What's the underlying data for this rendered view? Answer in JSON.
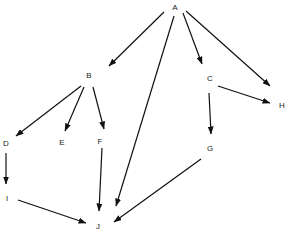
{
  "diagram": {
    "type": "directed-graph",
    "colors": {
      "edge": "#111111",
      "label": "#222222",
      "background": "#ffffff"
    },
    "nodes": [
      {
        "id": "A",
        "label": "A",
        "x": 175,
        "y": 8
      },
      {
        "id": "B",
        "label": "B",
        "x": 89,
        "y": 76
      },
      {
        "id": "C",
        "label": "C",
        "x": 210,
        "y": 79
      },
      {
        "id": "H",
        "label": "H",
        "x": 282,
        "y": 106
      },
      {
        "id": "D",
        "label": "D",
        "x": 6,
        "y": 144
      },
      {
        "id": "E",
        "label": "E",
        "x": 62,
        "y": 143
      },
      {
        "id": "F",
        "label": "F",
        "x": 100,
        "y": 142
      },
      {
        "id": "G",
        "label": "G",
        "x": 210,
        "y": 149
      },
      {
        "id": "I",
        "label": "I",
        "x": 7,
        "y": 199
      },
      {
        "id": "J",
        "label": "J",
        "x": 98,
        "y": 227
      }
    ],
    "edges": [
      {
        "from": "A",
        "to": "B",
        "x1": 164,
        "y1": 12,
        "x2": 109,
        "y2": 66
      },
      {
        "from": "A",
        "to": "J",
        "x1": 174,
        "y1": 16,
        "x2": 116,
        "y2": 206
      },
      {
        "from": "A",
        "to": "C",
        "x1": 183,
        "y1": 13,
        "x2": 202,
        "y2": 64
      },
      {
        "from": "A",
        "to": "H",
        "x1": 186,
        "y1": 11,
        "x2": 270,
        "y2": 86
      },
      {
        "from": "B",
        "to": "D",
        "x1": 81,
        "y1": 86,
        "x2": 16,
        "y2": 136
      },
      {
        "from": "B",
        "to": "E",
        "x1": 84,
        "y1": 87,
        "x2": 65,
        "y2": 131
      },
      {
        "from": "B",
        "to": "F",
        "x1": 93,
        "y1": 87,
        "x2": 104,
        "y2": 129
      },
      {
        "from": "C",
        "to": "H",
        "x1": 218,
        "y1": 86,
        "x2": 270,
        "y2": 103
      },
      {
        "from": "C",
        "to": "G",
        "x1": 209,
        "y1": 93,
        "x2": 211,
        "y2": 134
      },
      {
        "from": "D",
        "to": "I",
        "x1": 6,
        "y1": 153,
        "x2": 6,
        "y2": 184
      },
      {
        "from": "F",
        "to": "J",
        "x1": 102,
        "y1": 148,
        "x2": 99,
        "y2": 211
      },
      {
        "from": "I",
        "to": "J",
        "x1": 18,
        "y1": 200,
        "x2": 86,
        "y2": 223
      },
      {
        "from": "G",
        "to": "J",
        "x1": 201,
        "y1": 159,
        "x2": 114,
        "y2": 222
      }
    ]
  }
}
